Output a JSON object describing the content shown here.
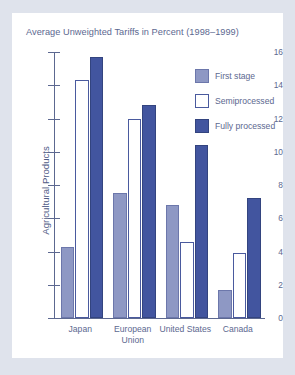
{
  "figure": {
    "background_color": "#dfe3ec",
    "card_color": "#ffffff",
    "text_color": "#5c6890"
  },
  "chart_data": {
    "type": "bar",
    "title": "Average Unweighted Tariffs in Percent (1998–1999)",
    "xlabel": "",
    "ylabel": "Agricultural Products",
    "categories": [
      "Japan",
      "European Union",
      "United States",
      "Canada"
    ],
    "category_lines": [
      [
        "Japan"
      ],
      [
        "European",
        "Union"
      ],
      [
        "United States"
      ],
      [
        "Canada"
      ]
    ],
    "series": [
      {
        "name": "First stage",
        "color": "#8e98c4",
        "values": [
          4.3,
          7.5,
          6.8,
          1.7
        ]
      },
      {
        "name": "Semiprocessed",
        "color": "#ffffff",
        "values": [
          14.3,
          12.0,
          4.6,
          3.9
        ]
      },
      {
        "name": "Fully processed",
        "color": "#42559f",
        "values": [
          15.7,
          12.8,
          10.4,
          7.2
        ]
      }
    ],
    "ylim": [
      0,
      16
    ],
    "yticks": [
      0,
      2,
      4,
      6,
      8,
      10,
      12,
      14,
      16
    ],
    "ytick_labels": [
      "0",
      "2",
      "4",
      "6",
      "8",
      "10",
      "12",
      "14",
      "16"
    ],
    "grid": false,
    "legend_position": "upper right"
  },
  "legend": {
    "items": [
      {
        "label": "First stage",
        "swatch": "first"
      },
      {
        "label": "Semiprocessed",
        "swatch": "semi"
      },
      {
        "label": "Fully processed",
        "swatch": "fully"
      }
    ]
  }
}
